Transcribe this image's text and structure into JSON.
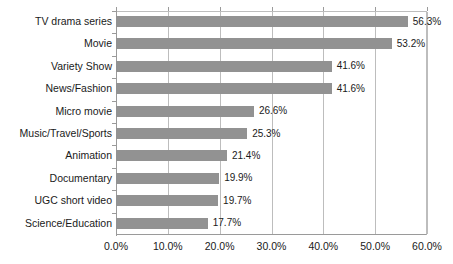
{
  "chart_data": {
    "type": "bar",
    "orientation": "horizontal",
    "title": "",
    "subtitle": "",
    "xlabel": "",
    "ylabel": "",
    "xlim": [
      0,
      60
    ],
    "xtick_step": 10,
    "grid": true,
    "legend": null,
    "bar_color": "#929292",
    "gridline_color": "#bdbdbd",
    "axis_color": "#9a9a9a",
    "value_suffix": "%",
    "categories": [
      "TV drama series",
      "Movie",
      "Variety Show",
      "News/Fashion",
      "Micro movie",
      "Music/Travel/Sports",
      "Animation",
      "Documentary",
      "UGC short video",
      "Science/Education"
    ],
    "values": [
      56.3,
      53.2,
      41.6,
      41.6,
      26.6,
      25.3,
      21.4,
      19.9,
      19.7,
      17.7
    ],
    "data_labels": [
      "56.3%",
      "53.2%",
      "41.6%",
      "41.6%",
      "26.6%",
      "25.3%",
      "21.4%",
      "19.9%",
      "19.7%",
      "17.7%"
    ],
    "xtick_labels": [
      "0.0%",
      "10.0%",
      "20.0%",
      "30.0%",
      "40.0%",
      "50.0%",
      "60.0%"
    ],
    "xtick_values": [
      0,
      10,
      20,
      30,
      40,
      50,
      60
    ]
  }
}
